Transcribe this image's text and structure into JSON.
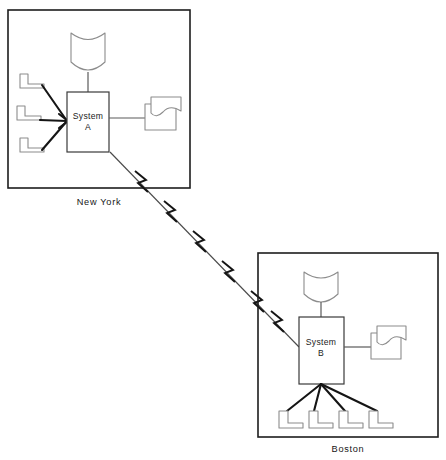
{
  "diagram": {
    "type": "network-topology",
    "background_color": "#ffffff",
    "line_color": "#1d1d1d",
    "device_outline_color": "#8c8c8c",
    "sites": [
      {
        "id": "new-york",
        "label": "New York",
        "frame": {
          "x": 8,
          "y": 10,
          "w": 182,
          "h": 178
        },
        "label_pos": {
          "x": 99,
          "y": 202
        },
        "host": {
          "id": "system-a",
          "line1": "System",
          "line2": "A",
          "box": {
            "x": 67,
            "y": 92,
            "w": 42,
            "h": 60
          },
          "label_pos": {
            "x": 88,
            "y": 119
          }
        },
        "tape_unit": {
          "id": "tape-drive-a",
          "icon": "magnetic-tape-icon",
          "cx": 88,
          "top": 33,
          "bottom": 72,
          "half_w": 17,
          "stand_top": 72,
          "stand_bottom": 92
        },
        "printer": {
          "id": "printer-a",
          "icon": "printer-document-icon",
          "base": {
            "x": 145,
            "y": 104,
            "w": 31,
            "h": 26
          },
          "sheet": {
            "x": 151,
            "y": 97,
            "w": 30,
            "h": 20
          },
          "link_from": {
            "x": 109,
            "y": 118
          },
          "link_to": {
            "x": 145,
            "y": 118
          }
        },
        "terminals": [
          {
            "id": "terminal-ny-1",
            "icon": "terminal-icon",
            "x": 20,
            "y": 74,
            "w": 24,
            "h": 19,
            "link_to": {
              "x": 67,
              "y": 121
            }
          },
          {
            "id": "terminal-ny-2",
            "icon": "terminal-icon",
            "x": 17,
            "y": 106,
            "w": 24,
            "h": 19,
            "link_to": {
              "x": 67,
              "y": 121
            }
          },
          {
            "id": "terminal-ny-3",
            "icon": "terminal-icon",
            "x": 20,
            "y": 138,
            "w": 24,
            "h": 19,
            "link_to": {
              "x": 67,
              "y": 121
            }
          }
        ]
      },
      {
        "id": "boston",
        "label": "Boston",
        "frame": {
          "x": 258,
          "y": 253,
          "w": 180,
          "h": 184
        },
        "label_pos": {
          "x": 348,
          "y": 450
        },
        "host": {
          "id": "system-b",
          "line1": "System",
          "line2": "B",
          "box": {
            "x": 299,
            "y": 317,
            "w": 45,
            "h": 67
          },
          "label_pos": {
            "x": 321,
            "y": 345
          }
        },
        "tape_unit": {
          "id": "tape-drive-b",
          "icon": "magnetic-tape-icon",
          "cx": 321,
          "top": 272,
          "bottom": 302,
          "half_w": 17,
          "stand_top": 302,
          "stand_bottom": 317
        },
        "printer": {
          "id": "printer-b",
          "icon": "printer-document-icon",
          "base": {
            "x": 371,
            "y": 333,
            "w": 30,
            "h": 26
          },
          "sheet": {
            "x": 377,
            "y": 326,
            "w": 29,
            "h": 20
          },
          "link_from": {
            "x": 344,
            "y": 347
          },
          "link_to": {
            "x": 371,
            "y": 347
          }
        },
        "terminals": [
          {
            "id": "terminal-bo-1",
            "icon": "terminal-icon",
            "x": 279,
            "y": 411,
            "w": 24,
            "h": 19,
            "link_to": {
              "x": 321,
              "y": 384
            }
          },
          {
            "id": "terminal-bo-2",
            "icon": "terminal-icon",
            "x": 309,
            "y": 411,
            "w": 24,
            "h": 19,
            "link_to": {
              "x": 321,
              "y": 384
            }
          },
          {
            "id": "terminal-bo-3",
            "icon": "terminal-icon",
            "x": 339,
            "y": 411,
            "w": 24,
            "h": 19,
            "link_to": {
              "x": 321,
              "y": 384
            }
          },
          {
            "id": "terminal-bo-4",
            "icon": "terminal-icon",
            "x": 369,
            "y": 411,
            "w": 24,
            "h": 19,
            "link_to": {
              "x": 321,
              "y": 384
            }
          }
        ]
      }
    ],
    "wan_link": {
      "id": "wan-link",
      "icon": "lightning-bolt-icon",
      "description": "Telecommunications link between System A and System B",
      "from": {
        "x": 110,
        "y": 152
      },
      "to": {
        "x": 299,
        "y": 347
      },
      "bolt_count": 6,
      "bolt_positions": [
        0.13,
        0.28,
        0.42,
        0.56,
        0.71,
        0.86
      ],
      "bolt_size": 13
    }
  }
}
